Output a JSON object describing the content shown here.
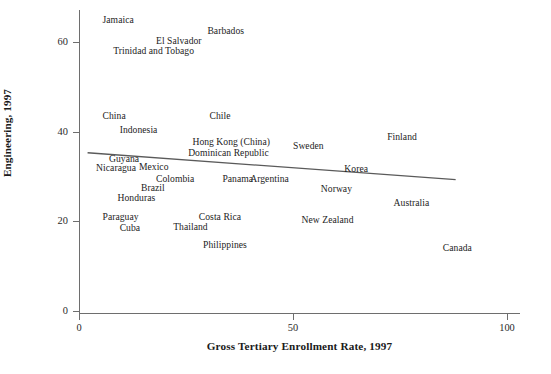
{
  "chart_data": {
    "type": "scatter",
    "title": "",
    "xlabel": "Gross Tertiary Enrollment Rate, 1997",
    "ylabel": "Percentage of Tertiary Students in Science and Engineering, 1997",
    "xlim": [
      0,
      105
    ],
    "ylim": [
      0,
      67
    ],
    "xticks": [
      "0",
      "50",
      "100"
    ],
    "xtick_values": [
      0,
      50,
      100
    ],
    "yticks": [
      "0",
      "20",
      "40",
      "60"
    ],
    "ytick_values": [
      0,
      20,
      40,
      60
    ],
    "grid": false,
    "legend": null,
    "marker_style": "text-label-only",
    "trendline": {
      "type": "linear-fit",
      "x_start": 2,
      "y_start": 35.3,
      "x_end": 88,
      "y_end": 29.3,
      "color": "#5a5a5a"
    },
    "points": [
      {
        "label": "Jamaica",
        "x": 5.5,
        "y": 65.0
      },
      {
        "label": "Barbados",
        "x": 30.0,
        "y": 62.5
      },
      {
        "label": "El Salvador",
        "x": 18.0,
        "y": 60.3
      },
      {
        "label": "Trinidad and Tobago",
        "x": 8.0,
        "y": 58.0
      },
      {
        "label": "China",
        "x": 5.5,
        "y": 43.6
      },
      {
        "label": "Chile",
        "x": 30.5,
        "y": 43.6
      },
      {
        "label": "Finland",
        "x": 72.0,
        "y": 38.8
      },
      {
        "label": "Indonesia",
        "x": 9.5,
        "y": 40.3
      },
      {
        "label": "Sweden",
        "x": 50.0,
        "y": 36.8
      },
      {
        "label": "Hong Kong (China)",
        "x": 26.5,
        "y": 37.8
      },
      {
        "label": "Dominican Republic",
        "x": 25.5,
        "y": 35.3
      },
      {
        "label": "Guyana",
        "x": 7.0,
        "y": 34.0
      },
      {
        "label": "Korea",
        "x": 62.0,
        "y": 31.6
      },
      {
        "label": "Nicaragua",
        "x": 4.0,
        "y": 32.0
      },
      {
        "label": "Mexico",
        "x": 14.0,
        "y": 32.2
      },
      {
        "label": "Colombia",
        "x": 18.0,
        "y": 29.4
      },
      {
        "label": "Panama",
        "x": 33.5,
        "y": 29.4
      },
      {
        "label": "Argentina",
        "x": 40.0,
        "y": 29.4
      },
      {
        "label": "Brazil",
        "x": 14.5,
        "y": 27.4
      },
      {
        "label": "Norway",
        "x": 56.5,
        "y": 27.2
      },
      {
        "label": "Honduras",
        "x": 9.0,
        "y": 25.2
      },
      {
        "label": "Australia",
        "x": 73.5,
        "y": 24.0
      },
      {
        "label": "Paraguay",
        "x": 5.5,
        "y": 20.9
      },
      {
        "label": "Costa Rica",
        "x": 28.0,
        "y": 21.0
      },
      {
        "label": "New Zealand",
        "x": 52.0,
        "y": 20.4
      },
      {
        "label": "Thailand",
        "x": 22.0,
        "y": 18.7
      },
      {
        "label": "Cuba",
        "x": 9.5,
        "y": 18.6
      },
      {
        "label": "Philippines",
        "x": 29.0,
        "y": 14.8
      },
      {
        "label": "Canada",
        "x": 85.0,
        "y": 14.1
      }
    ]
  }
}
